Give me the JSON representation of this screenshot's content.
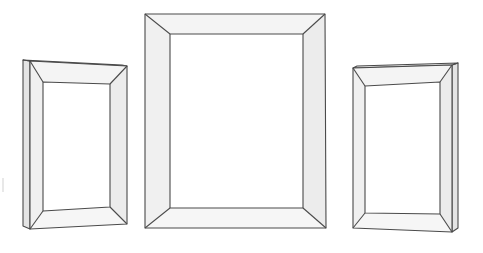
{
  "scene": {
    "title": "Three empty picture frames",
    "background": "#ffffff",
    "stroke_color": "#4a4a4a",
    "width": 483,
    "height": 253
  },
  "frames": [
    {
      "id": "left",
      "label": "left-frame",
      "orientation": "angled-left",
      "outer": [
        [
          30,
          61
        ],
        [
          127,
          66
        ],
        [
          127,
          224
        ],
        [
          30,
          229
        ]
      ],
      "inner": [
        [
          43,
          82
        ],
        [
          110,
          84
        ],
        [
          110,
          207
        ],
        [
          43,
          211
        ]
      ],
      "thickness_side": [
        [
          23,
          60
        ],
        [
          30,
          61
        ],
        [
          30,
          229
        ],
        [
          23,
          226
        ]
      ],
      "thickness_top": [
        [
          23,
          60
        ],
        [
          30,
          61
        ],
        [
          127,
          66
        ],
        [
          122,
          65
        ]
      ]
    },
    {
      "id": "center",
      "label": "center-frame",
      "orientation": "front",
      "outer": [
        [
          145,
          14
        ],
        [
          325,
          14
        ],
        [
          326,
          228
        ],
        [
          145,
          228
        ]
      ],
      "inner": [
        [
          170,
          34
        ],
        [
          303,
          34
        ],
        [
          303,
          208
        ],
        [
          170,
          208
        ]
      ]
    },
    {
      "id": "right",
      "label": "right-frame",
      "orientation": "angled-right",
      "outer": [
        [
          353,
          68
        ],
        [
          452,
          65
        ],
        [
          452,
          232
        ],
        [
          353,
          228
        ]
      ],
      "inner": [
        [
          365,
          86
        ],
        [
          440,
          82
        ],
        [
          440,
          214
        ],
        [
          365,
          213
        ]
      ],
      "thickness_side": [
        [
          452,
          65
        ],
        [
          458,
          63
        ],
        [
          458,
          228
        ],
        [
          452,
          232
        ]
      ],
      "thickness_top": [
        [
          357,
          66
        ],
        [
          458,
          63
        ],
        [
          452,
          65
        ],
        [
          353,
          68
        ]
      ]
    }
  ],
  "artifacts": [
    {
      "label": "left-edge-smudge",
      "x": 2,
      "y": 178,
      "w": 2,
      "h": 14
    }
  ]
}
